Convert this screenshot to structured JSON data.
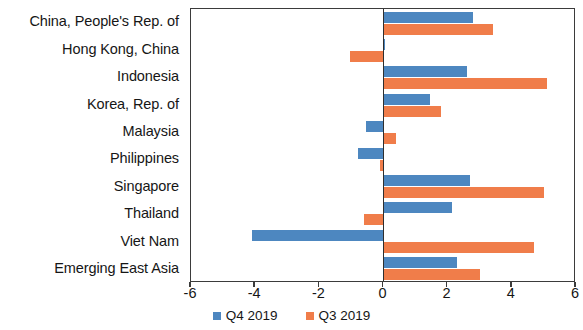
{
  "chart_data": {
    "type": "bar",
    "orientation": "horizontal",
    "title": "",
    "subtitle": "",
    "xlabel": "",
    "ylabel": "",
    "xlim": [
      -6,
      6
    ],
    "xticks": [
      -6,
      -4,
      -2,
      0,
      2,
      4,
      6
    ],
    "xtick_labels": [
      "-6",
      "-4",
      "-2",
      "0",
      "2",
      "4",
      "6"
    ],
    "grid": false,
    "legend_position": "bottom-center",
    "categories": [
      "China, People's Rep. of",
      "Hong Kong, China",
      "Indonesia",
      "Korea, Rep. of",
      "Malaysia",
      "Philippines",
      "Singapore",
      "Thailand",
      "Viet Nam",
      "Emerging East Asia"
    ],
    "series": [
      {
        "name": "Q4 2019",
        "color": "#4d87c0",
        "values": [
          2.8,
          0.05,
          2.6,
          1.45,
          -0.55,
          -0.8,
          2.7,
          2.15,
          -4.1,
          2.3
        ]
      },
      {
        "name": "Q3 2019",
        "color": "#f07d4a",
        "values": [
          3.4,
          -1.05,
          5.1,
          1.8,
          0.4,
          -0.1,
          5.0,
          -0.6,
          4.7,
          3.0
        ]
      }
    ]
  },
  "legend": {
    "entries": [
      {
        "label": "Q4 2019",
        "color": "#4d87c0"
      },
      {
        "label": "Q3 2019",
        "color": "#f07d4a"
      }
    ]
  }
}
